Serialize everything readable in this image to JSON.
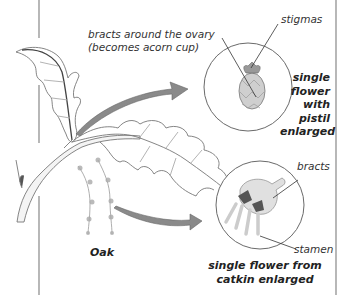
{
  "diagram": {
    "subject": "Oak",
    "labels": {
      "bracts_ovary": [
        "bracts around the ovary",
        "(becomes acorn cup)"
      ],
      "stigmas": "stigmas",
      "pistil_caption": [
        "single",
        "flower",
        "with",
        "pistil",
        "enlarged"
      ],
      "bracts": "bracts",
      "stamen": "stamen",
      "catkin_caption": [
        "single flower from",
        "catkin enlarged"
      ],
      "plant_name": "Oak"
    },
    "colors": {
      "line": "#555555",
      "arrow_fill": "#8a8a8a",
      "circle": "#6a6a6a",
      "border": "#777777",
      "text": "#333333"
    }
  }
}
